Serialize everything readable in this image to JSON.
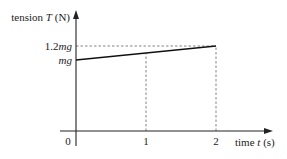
{
  "chart_data": {
    "type": "line",
    "title": "",
    "xlabel": "time t (s)",
    "ylabel": "tension T (N)",
    "xlabel_parts": {
      "pre": "time ",
      "var": "t",
      "post": " (s)"
    },
    "ylabel_parts": {
      "pre": "tension ",
      "var": "T",
      "post": " (N)"
    },
    "xlim": [
      0,
      2.85
    ],
    "ylim": [
      0,
      1.25
    ],
    "x_ticks": [
      {
        "value": 0,
        "label": "0"
      },
      {
        "value": 1,
        "label": "1"
      },
      {
        "value": 2,
        "label": "2"
      }
    ],
    "y_ticks": [
      {
        "value": 1.0,
        "label_num": "",
        "label_var": "mg"
      },
      {
        "value": 1.2,
        "label_num": "1.2",
        "label_var": "mg"
      }
    ],
    "series": [
      {
        "name": "tension",
        "x": [
          0,
          2
        ],
        "y": [
          1.0,
          1.2
        ]
      }
    ],
    "guides": [
      {
        "type": "horizontal",
        "y": 1.2,
        "x_from": 0,
        "x_to": 2
      },
      {
        "type": "vertical",
        "x": 1,
        "y_from": 0,
        "y_to": 1.1
      },
      {
        "type": "vertical",
        "x": 2,
        "y_from": 0,
        "y_to": 1.2
      }
    ],
    "y_unit_note": "values in units of mg",
    "grid": false,
    "legend": "none"
  }
}
